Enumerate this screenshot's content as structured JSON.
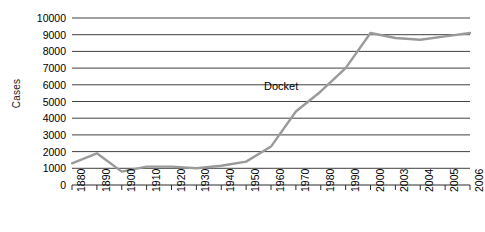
{
  "chart_data": {
    "type": "line",
    "title": "",
    "xlabel": "",
    "ylabel": "Cases",
    "categories": [
      "1880",
      "1890",
      "1900",
      "1910",
      "1920",
      "1930",
      "1940",
      "1950",
      "1960",
      "1970",
      "1980",
      "1990",
      "2000",
      "2003",
      "2004",
      "2005",
      "2006"
    ],
    "x_tick_labels": [
      "1880",
      "1890",
      "1900",
      "1910",
      "1920",
      "1930",
      "1940",
      "1950",
      "1960",
      "1970",
      "1980",
      "1990",
      "2000",
      "2003",
      "2004",
      "2005",
      "2006"
    ],
    "y_tick_labels": [
      "10000",
      "9000",
      "8000",
      "7000",
      "6000",
      "5000",
      "4000",
      "3000",
      "2000",
      "1000",
      "0"
    ],
    "ylim": [
      0,
      10000
    ],
    "y_ticks": [
      0,
      1000,
      2000,
      3000,
      4000,
      5000,
      6000,
      7000,
      8000,
      9000,
      10000
    ],
    "grid": true,
    "grid_axis": "y",
    "legend_position": "inline-annotation",
    "series": [
      {
        "name": "Docket",
        "label": "Docket",
        "color": "#9a9a9a",
        "values": [
          1300,
          1900,
          800,
          1100,
          1100,
          1000,
          1150,
          1400,
          2300,
          4400,
          5600,
          7000,
          9100,
          8800,
          8700,
          8900,
          9100
        ]
      }
    ],
    "annotations": [
      {
        "text": "Docket",
        "x_category": "1970",
        "y_value": 5800
      }
    ],
    "colors": {
      "line": "#9a9a9a",
      "grid": "#2b2b2b",
      "axis": "#2b2b2b",
      "text": "#000000",
      "background": "#ffffff"
    }
  }
}
